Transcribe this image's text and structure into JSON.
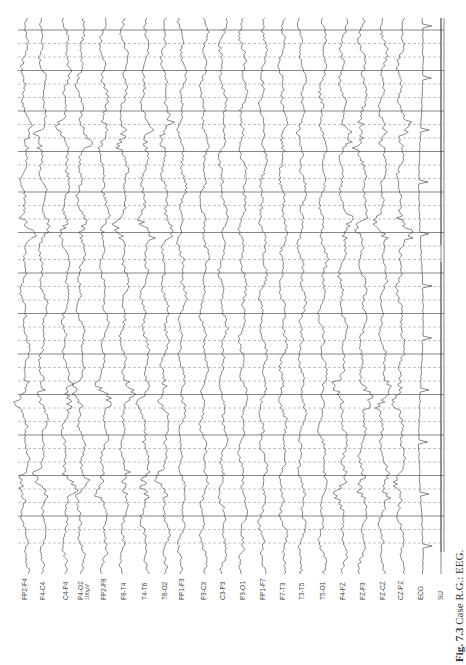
{
  "figure": {
    "caption_label": "Fig. 7.3",
    "caption_text": " Case R.G.: EEG.",
    "orientation": "rotated 90° counter-clockwise",
    "scale_bar_label": "100μV",
    "colors": {
      "trace": "#3a3a3a",
      "grid_solid": "#555555",
      "grid_dashed": "#888888",
      "background": "#ffffff"
    }
  },
  "channels": [
    {
      "label": "FP2-F4",
      "x": 25
    },
    {
      "label": "F4-C4",
      "x": 43
    },
    {
      "label": "C4-P4",
      "x": 66
    },
    {
      "label": "P4-O2",
      "x": 81
    },
    {
      "label": "FP2-F8",
      "x": 104
    },
    {
      "label": "F8-T4",
      "x": 124
    },
    {
      "label": "T4-T6",
      "x": 145
    },
    {
      "label": "T6-O2",
      "x": 165
    },
    {
      "label": "FP1-F3",
      "x": 182
    },
    {
      "label": "F3-C3",
      "x": 204
    },
    {
      "label": "C3-P3",
      "x": 223
    },
    {
      "label": "P3-O1",
      "x": 243
    },
    {
      "label": "FP1-F7",
      "x": 263
    },
    {
      "label": "F7-T3",
      "x": 283
    },
    {
      "label": "T3-T5",
      "x": 302
    },
    {
      "label": "T5-O1",
      "x": 323
    },
    {
      "label": "F4-FZ",
      "x": 343
    },
    {
      "label": "FZ-F3",
      "x": 363
    },
    {
      "label": "FZ-CZ",
      "x": 383
    },
    {
      "label": "CZ-PZ",
      "x": 401
    },
    {
      "label": "ECG",
      "x": 421
    },
    {
      "label": "SU",
      "x": 441
    }
  ],
  "grid": {
    "top": 30,
    "bottom": 552,
    "left": 18,
    "right": 444,
    "spacing": 13.5
  }
}
